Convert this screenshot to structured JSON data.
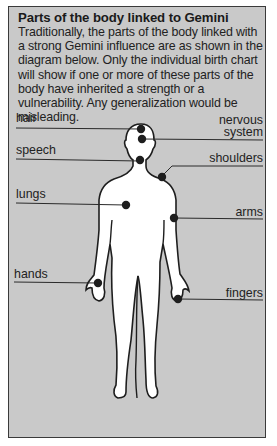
{
  "title": "Parts of the body linked to Gemini",
  "description": "Traditionally, the parts of the body linked with a strong Gemini influence are as shown in the diagram below. Only the individual birth chart will show if one or more of these parts of the body have inherited a strength or a vulnerability. Any generalization would be misleading.",
  "labels": {
    "hair": "hair",
    "nervous_system_line1": "nervous",
    "nervous_system_line2": "system",
    "speech": "speech",
    "shoulders": "shoulders",
    "lungs": "lungs",
    "arms": "arms",
    "hands": "hands",
    "fingers": "fingers"
  },
  "colors": {
    "background": "#c9c9c9",
    "body": "#ffffff",
    "outline": "#1e1e1e",
    "marker": "#1e1e1e"
  }
}
